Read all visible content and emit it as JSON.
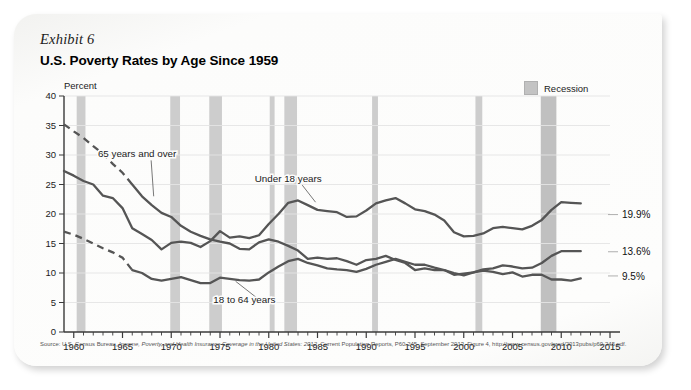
{
  "card": {
    "exhibit_label": "Exhibit 6",
    "title": "U.S. Poverty Rates by Age Since 1959"
  },
  "legend": {
    "recession_label": "Recession",
    "recession_color": "#c3c3c3"
  },
  "axes": {
    "y_unit_label": "Percent",
    "y_ticks": [
      0,
      5,
      10,
      15,
      20,
      25,
      30,
      35,
      40
    ],
    "x_ticks": [
      1960,
      1965,
      1970,
      1975,
      1980,
      1985,
      1990,
      1995,
      2000,
      2005,
      2010,
      2015
    ]
  },
  "source": {
    "prefix": "Source: U.S. Census Bureau, ",
    "italic": "Income, Poverty, and Health Insurance Coverage in the United States: 2012",
    "suffix": ", Current Population Reports, P60-245, September 2013, Figure 4, http://www.census.gov/prod/2013pubs/p60-245.pdf."
  },
  "chart_data": {
    "type": "line",
    "title": "U.S. Poverty Rates by Age Since 1959",
    "xlabel": "",
    "ylabel": "Percent",
    "xlim": [
      1959,
      2015
    ],
    "ylim": [
      0,
      40
    ],
    "grid": true,
    "legend_position": "top-right",
    "annotations": [
      {
        "text": "65 years and over",
        "x": 1966.5,
        "y": 29.6,
        "anchor_x": 1968.2,
        "anchor_y": 23.0
      },
      {
        "text": "Under 18 years",
        "x": 1982.0,
        "y": 25.4,
        "anchor_x": 1984.8,
        "anchor_y": 22.0
      },
      {
        "text": "18 to 64 years",
        "x": 1977.5,
        "y": 4.9,
        "anchor_x": 1976.6,
        "anchor_y": 8.6
      }
    ],
    "end_labels": [
      {
        "series": "Under 18 years",
        "value": "19.9%",
        "y": 19.9
      },
      {
        "series": "65 years and over",
        "value": "13.6%",
        "y": 13.6
      },
      {
        "series": "18 to 64 years",
        "value": "9.5%",
        "y": 9.5
      }
    ],
    "recession_bands": [
      {
        "start": 1960.3,
        "end": 1961.2
      },
      {
        "start": 1969.9,
        "end": 1970.9
      },
      {
        "start": 1973.9,
        "end": 1975.2
      },
      {
        "start": 1980.1,
        "end": 1980.6
      },
      {
        "start": 1981.6,
        "end": 1982.9
      },
      {
        "start": 1990.6,
        "end": 1991.2
      },
      {
        "start": 2001.2,
        "end": 2001.9
      },
      {
        "start": 2007.9,
        "end": 2009.5
      }
    ],
    "series": [
      {
        "name": "65 years and over",
        "style": "solid-with-dashed-lead",
        "dashed_until": 1966,
        "x": [
          1959,
          1960,
          1961,
          1962,
          1963,
          1964,
          1965,
          1966,
          1967,
          1968,
          1969,
          1970,
          1971,
          1972,
          1973,
          1974,
          1975,
          1976,
          1977,
          1978,
          1979,
          1980,
          1981,
          1982,
          1983,
          1984,
          1985,
          1986,
          1987,
          1988,
          1989,
          1990,
          1991,
          1992,
          1993,
          1994,
          1995,
          1996,
          1997,
          1998,
          1999,
          2000,
          2001,
          2002,
          2003,
          2004,
          2005,
          2006,
          2007,
          2008,
          2009,
          2010,
          2011,
          2012
        ],
        "y": [
          35.2,
          34.0,
          32.9,
          31.5,
          30.2,
          28.5,
          27.0,
          25.0,
          23.0,
          21.5,
          20.2,
          19.5,
          18.0,
          17.0,
          16.3,
          15.7,
          15.3,
          15.0,
          14.1,
          14.0,
          15.2,
          15.7,
          15.3,
          14.6,
          13.8,
          12.4,
          12.6,
          12.4,
          12.5,
          12.0,
          11.4,
          12.2,
          12.4,
          12.9,
          12.2,
          11.7,
          10.5,
          10.8,
          10.5,
          10.5,
          9.7,
          9.9,
          10.1,
          10.4,
          10.2,
          9.8,
          10.1,
          9.4,
          9.7,
          9.7,
          8.9,
          8.9,
          8.7,
          9.1
        ]
      },
      {
        "name": "Under 18 years",
        "style": "solid",
        "x": [
          1959,
          1960,
          1961,
          1962,
          1963,
          1964,
          1965,
          1966,
          1967,
          1968,
          1969,
          1970,
          1971,
          1972,
          1973,
          1974,
          1975,
          1976,
          1977,
          1978,
          1979,
          1980,
          1981,
          1982,
          1983,
          1984,
          1985,
          1986,
          1987,
          1988,
          1989,
          1990,
          1991,
          1992,
          1993,
          1994,
          1995,
          1996,
          1997,
          1998,
          1999,
          2000,
          2001,
          2002,
          2003,
          2004,
          2005,
          2006,
          2007,
          2008,
          2009,
          2010,
          2011,
          2012
        ],
        "y": [
          27.3,
          26.5,
          25.6,
          25.0,
          23.1,
          22.7,
          21.0,
          17.6,
          16.6,
          15.6,
          14.0,
          15.1,
          15.3,
          15.1,
          14.4,
          15.4,
          17.1,
          16.0,
          16.2,
          15.9,
          16.4,
          18.3,
          20.0,
          21.9,
          22.3,
          21.5,
          20.7,
          20.5,
          20.3,
          19.5,
          19.6,
          20.6,
          21.8,
          22.3,
          22.7,
          21.8,
          20.8,
          20.5,
          19.9,
          18.9,
          16.9,
          16.2,
          16.3,
          16.7,
          17.6,
          17.8,
          17.6,
          17.4,
          18.0,
          19.0,
          20.7,
          22.0,
          21.9,
          21.8
        ]
      },
      {
        "name": "18 to 64 years",
        "style": "solid-with-dashed-lead",
        "dashed_until": 1966,
        "x": [
          1959,
          1960,
          1961,
          1962,
          1963,
          1964,
          1965,
          1966,
          1967,
          1968,
          1969,
          1970,
          1971,
          1972,
          1973,
          1974,
          1975,
          1976,
          1977,
          1978,
          1979,
          1980,
          1981,
          1982,
          1983,
          1984,
          1985,
          1986,
          1987,
          1988,
          1989,
          1990,
          1991,
          1992,
          1993,
          1994,
          1995,
          1996,
          1997,
          1998,
          1999,
          2000,
          2001,
          2002,
          2003,
          2004,
          2005,
          2006,
          2007,
          2008,
          2009,
          2010,
          2011,
          2012
        ],
        "y": [
          17.0,
          16.5,
          15.8,
          15.0,
          14.2,
          13.5,
          12.6,
          10.5,
          10.0,
          9.0,
          8.7,
          9.0,
          9.3,
          8.8,
          8.3,
          8.3,
          9.2,
          9.0,
          8.8,
          8.7,
          8.9,
          10.1,
          11.1,
          12.0,
          12.4,
          11.7,
          11.3,
          10.8,
          10.6,
          10.5,
          10.2,
          10.7,
          11.4,
          11.9,
          12.4,
          11.9,
          11.4,
          11.4,
          10.9,
          10.5,
          10.0,
          9.6,
          10.1,
          10.6,
          10.8,
          11.3,
          11.1,
          10.8,
          10.9,
          11.7,
          12.9,
          13.7,
          13.7,
          13.7
        ]
      }
    ]
  }
}
